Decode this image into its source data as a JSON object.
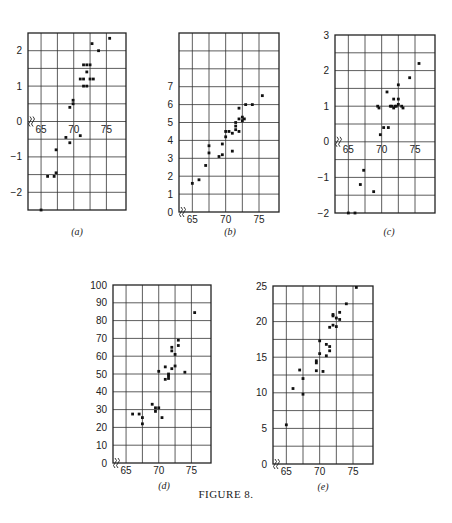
{
  "figure": {
    "caption": "FIGURE 8."
  },
  "chart_data": [
    {
      "id": "a",
      "label": "(a)",
      "type": "scatter",
      "box": {
        "left": 28,
        "top": 33,
        "width": 98,
        "height": 177
      },
      "xlim": [
        63,
        78
      ],
      "ylim": [
        -2.5,
        2.5
      ],
      "xgrid": [
        65,
        67.5,
        70,
        72.5,
        75
      ],
      "ygrid": [
        -2,
        -1.5,
        -1,
        -0.5,
        0,
        0.5,
        1,
        1.5,
        2
      ],
      "xticks": [
        65,
        70,
        75
      ],
      "yticks": [
        -2,
        -1,
        0,
        1,
        2
      ],
      "xaxis_at": 0,
      "axis_break": true,
      "points": [
        [
          65,
          -2.5
        ],
        [
          66,
          -1.55
        ],
        [
          67,
          -1.55
        ],
        [
          67.3,
          -1.45
        ],
        [
          67.3,
          -0.8
        ],
        [
          68.8,
          -0.45
        ],
        [
          69.4,
          -0.6
        ],
        [
          71,
          -0.4
        ],
        [
          69.4,
          0.4
        ],
        [
          69.9,
          0.5
        ],
        [
          69.9,
          0.6
        ],
        [
          71,
          1.2
        ],
        [
          71.5,
          1.2
        ],
        [
          71.5,
          1.0
        ],
        [
          72,
          1.0
        ],
        [
          71.5,
          1.6
        ],
        [
          72,
          1.6
        ],
        [
          72.5,
          1.6
        ],
        [
          72,
          1.4
        ],
        [
          72.5,
          1.2
        ],
        [
          73,
          1.2
        ],
        [
          72.8,
          2.2
        ],
        [
          73.8,
          2.0
        ],
        [
          75.5,
          2.35
        ]
      ]
    },
    {
      "id": "b",
      "label": "(b)",
      "type": "scatter",
      "box": {
        "left": 179,
        "top": 33,
        "width": 100,
        "height": 179
      },
      "xlim": [
        63,
        78
      ],
      "ylim": [
        0,
        10
      ],
      "xgrid": [
        65,
        67.5,
        70,
        72.5,
        75
      ],
      "ygrid": [
        1,
        2,
        3,
        4,
        5,
        6,
        7,
        8,
        9
      ],
      "xticks": [
        65,
        70,
        75
      ],
      "yticks": [
        0,
        1,
        2,
        3,
        4,
        5,
        6,
        7
      ],
      "xaxis_at": 0,
      "axis_break": true,
      "points": [
        [
          65,
          1.6
        ],
        [
          66,
          1.8
        ],
        [
          67,
          2.6
        ],
        [
          67.5,
          3.3
        ],
        [
          67.5,
          3.7
        ],
        [
          69,
          3.1
        ],
        [
          69.5,
          3.2
        ],
        [
          69.5,
          3.8
        ],
        [
          70,
          4.2
        ],
        [
          70,
          4.5
        ],
        [
          70.5,
          4.5
        ],
        [
          71,
          4.4
        ],
        [
          71,
          3.4
        ],
        [
          71.5,
          4.6
        ],
        [
          71.5,
          4.8
        ],
        [
          71.5,
          5.0
        ],
        [
          72,
          4.5
        ],
        [
          72,
          5.2
        ],
        [
          72.5,
          5.3
        ],
        [
          72.5,
          5.1
        ],
        [
          72.8,
          5.2
        ],
        [
          72,
          5.8
        ],
        [
          73,
          6.0
        ],
        [
          74,
          6.0
        ],
        [
          75.5,
          6.5
        ]
      ]
    },
    {
      "id": "c",
      "label": "(c)",
      "type": "scatter",
      "box": {
        "left": 335,
        "top": 35,
        "width": 100,
        "height": 178
      },
      "xlim": [
        63,
        78
      ],
      "ylim": [
        -2,
        3
      ],
      "xgrid": [
        65,
        67.5,
        70,
        72.5,
        75
      ],
      "ygrid": [
        -1.5,
        -1,
        -0.5,
        0,
        0.5,
        1,
        1.5,
        2,
        2.5
      ],
      "xticks": [
        65,
        70,
        75
      ],
      "yticks": [
        -2,
        -1,
        0,
        1,
        2,
        3
      ],
      "xaxis_at": 0,
      "axis_break": true,
      "points": [
        [
          65,
          -2.0
        ],
        [
          66,
          -2.0
        ],
        [
          66.8,
          -1.2
        ],
        [
          67.3,
          -0.8
        ],
        [
          68.8,
          -1.4
        ],
        [
          69.4,
          1.0
        ],
        [
          69.6,
          0.95
        ],
        [
          69.8,
          0.2
        ],
        [
          70.3,
          0.4
        ],
        [
          71,
          0.4
        ],
        [
          70.8,
          1.4
        ],
        [
          71.3,
          1.0
        ],
        [
          71.5,
          1.0
        ],
        [
          71.8,
          0.95
        ],
        [
          72,
          1.0
        ],
        [
          72.2,
          1.0
        ],
        [
          72.5,
          1.05
        ],
        [
          71.8,
          1.2
        ],
        [
          72.5,
          1.2
        ],
        [
          72.5,
          1.6
        ],
        [
          73,
          1.0
        ],
        [
          73.2,
          0.95
        ],
        [
          74.2,
          1.8
        ],
        [
          75.6,
          2.2
        ]
      ]
    },
    {
      "id": "d",
      "label": "(d)",
      "type": "scatter",
      "box": {
        "left": 113,
        "top": 285,
        "width": 98,
        "height": 178
      },
      "xlim": [
        63,
        78
      ],
      "ylim": [
        0,
        100
      ],
      "xgrid": [
        65,
        67.5,
        70,
        72.5,
        75
      ],
      "ygrid": [
        10,
        20,
        30,
        40,
        50,
        60,
        70,
        80,
        90
      ],
      "xticks": [
        65,
        70,
        75
      ],
      "yticks": [
        0,
        10,
        20,
        30,
        40,
        50,
        60,
        70,
        80,
        90,
        100
      ],
      "xaxis_at": 0,
      "axis_break": true,
      "points": [
        [
          66,
          27.5
        ],
        [
          67,
          27.5
        ],
        [
          67.5,
          25.5
        ],
        [
          67.5,
          22
        ],
        [
          69,
          33
        ],
        [
          69.5,
          31
        ],
        [
          69.5,
          29
        ],
        [
          70,
          31
        ],
        [
          70,
          51.5
        ],
        [
          70.5,
          25.5
        ],
        [
          71,
          47
        ],
        [
          71,
          54
        ],
        [
          71.5,
          47.5
        ],
        [
          71.5,
          49
        ],
        [
          71.5,
          50
        ],
        [
          72,
          53
        ],
        [
          72,
          63
        ],
        [
          72,
          65
        ],
        [
          72.5,
          61
        ],
        [
          72.5,
          54.5
        ],
        [
          73,
          66
        ],
        [
          73,
          69
        ],
        [
          74,
          51
        ],
        [
          75.5,
          84.5
        ]
      ]
    },
    {
      "id": "e",
      "label": "(e)",
      "type": "scatter",
      "box": {
        "left": 273,
        "top": 286,
        "width": 100,
        "height": 178
      },
      "xlim": [
        63,
        78
      ],
      "ylim": [
        0,
        25
      ],
      "xgrid": [
        65,
        67.5,
        70,
        72.5,
        75
      ],
      "ygrid": [
        2.5,
        5,
        7.5,
        10,
        12.5,
        15,
        17.5,
        20,
        22.5
      ],
      "xticks": [
        65,
        70,
        75
      ],
      "yticks": [
        0,
        5,
        10,
        15,
        20,
        25
      ],
      "xaxis_at": 0,
      "axis_break": true,
      "points": [
        [
          65,
          5.5
        ],
        [
          66,
          10.6
        ],
        [
          67,
          13.2
        ],
        [
          67.5,
          12
        ],
        [
          67.5,
          9.8
        ],
        [
          69.5,
          13.1
        ],
        [
          69.5,
          14.2
        ],
        [
          69.5,
          14.5
        ],
        [
          70,
          15.5
        ],
        [
          70,
          17.3
        ],
        [
          70.5,
          13
        ],
        [
          71,
          15.2
        ],
        [
          71,
          16.8
        ],
        [
          71.5,
          16.5
        ],
        [
          71.5,
          15.9
        ],
        [
          71.5,
          19.2
        ],
        [
          72,
          19.5
        ],
        [
          72,
          20.8
        ],
        [
          72,
          21
        ],
        [
          72.5,
          19.3
        ],
        [
          72.5,
          20.5
        ],
        [
          73,
          20.3
        ],
        [
          73,
          21.3
        ],
        [
          74,
          22.5
        ],
        [
          75.5,
          24.8
        ]
      ]
    }
  ]
}
